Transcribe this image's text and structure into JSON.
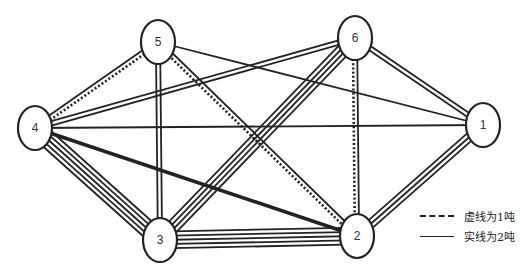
{
  "diagram": {
    "type": "multigraph",
    "nodes": [
      {
        "id": "1",
        "label": "1",
        "x": 483,
        "y": 125
      },
      {
        "id": "2",
        "label": "2",
        "x": 357,
        "y": 236
      },
      {
        "id": "3",
        "label": "3",
        "x": 160,
        "y": 240
      },
      {
        "id": "4",
        "label": "4",
        "x": 35,
        "y": 128
      },
      {
        "id": "5",
        "label": "5",
        "x": 158,
        "y": 42
      },
      {
        "id": "6",
        "label": "6",
        "x": 355,
        "y": 38
      }
    ],
    "edges": [
      {
        "from": "4",
        "to": "5",
        "solid": 1,
        "dashed": 1
      },
      {
        "from": "4",
        "to": "6",
        "solid": 2,
        "dashed": 0
      },
      {
        "from": "4",
        "to": "1",
        "solid": 1,
        "dashed": 0
      },
      {
        "from": "4",
        "to": "2",
        "solid": 2,
        "dashed": 0,
        "thick": true
      },
      {
        "from": "4",
        "to": "3",
        "solid": 5,
        "dashed": 0
      },
      {
        "from": "5",
        "to": "1",
        "solid": 1,
        "dashed": 0
      },
      {
        "from": "5",
        "to": "3",
        "solid": 2,
        "dashed": 0
      },
      {
        "from": "5",
        "to": "2",
        "solid": 1,
        "dashed": 1
      },
      {
        "from": "6",
        "to": "1",
        "solid": 2,
        "dashed": 0
      },
      {
        "from": "6",
        "to": "3",
        "solid": 4,
        "dashed": 0
      },
      {
        "from": "6",
        "to": "2",
        "solid": 1,
        "dashed": 1
      },
      {
        "from": "1",
        "to": "2",
        "solid": 3,
        "dashed": 0
      },
      {
        "from": "3",
        "to": "2",
        "solid": 5,
        "dashed": 0
      }
    ],
    "colors": {
      "line": "#222222",
      "node_fill": "#ffffff",
      "background": "#ffffff"
    }
  },
  "legend": {
    "dashed_label": "虚线为1吨",
    "solid_label": "实线为2吨"
  }
}
